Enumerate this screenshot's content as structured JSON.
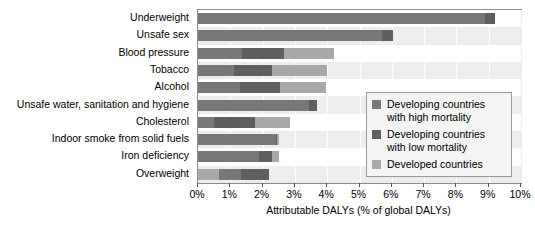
{
  "chart_data": {
    "type": "bar",
    "orientation": "horizontal",
    "stacked": true,
    "title": "",
    "xlabel": "Attributable DALYs (% of global DALYs)",
    "ylabel": "",
    "xlim": [
      0,
      10
    ],
    "xtick_labels": [
      "0%",
      "1%",
      "2%",
      "3%",
      "4%",
      "5%",
      "6%",
      "7%",
      "8%",
      "9%",
      "10%"
    ],
    "xticks": [
      0,
      1,
      2,
      3,
      4,
      5,
      6,
      7,
      8,
      9,
      10
    ],
    "grid": true,
    "legend_position": "center-right",
    "categories": [
      "Underweight",
      "Unsafe sex",
      "Blood pressure",
      "Tobacco",
      "Alcohol",
      "Unsafe water, sanitation and hygiene",
      "Cholesterol",
      "Indoor smoke from solid fuels",
      "Iron deficiency",
      "Overweight"
    ],
    "series": [
      {
        "name": "Developing countries with high mortality",
        "color": "#787878",
        "values": [
          8.9,
          5.7,
          1.35,
          1.1,
          1.3,
          3.45,
          0.5,
          2.4,
          1.9,
          0.0
        ]
      },
      {
        "name": "Developing countries with low mortality",
        "color": "#5f5f5f",
        "values": [
          0.3,
          0.35,
          1.3,
          1.2,
          1.25,
          0.25,
          1.25,
          0.05,
          0.4,
          0.0
        ]
      },
      {
        "name": "Developed countries",
        "color": "#a8a8a8",
        "values": [
          0.0,
          0.0,
          1.55,
          1.7,
          1.4,
          0.0,
          1.1,
          0.05,
          0.2,
          2.2
        ]
      }
    ],
    "totals": [
      9.2,
      6.05,
      4.2,
      4.0,
      3.95,
      3.7,
      2.85,
      2.5,
      2.5,
      2.2
    ],
    "segment_order_note": "Overweight is drawn as Developed(0.65) then High(0.68) then Low(0.87)",
    "overweight_segments": [
      {
        "series": "Developed countries",
        "value": 0.65
      },
      {
        "series": "Developing countries with high mortality",
        "value": 0.68
      },
      {
        "series": "Developing countries with low mortality",
        "value": 0.87
      }
    ]
  },
  "legend": {
    "items": [
      {
        "label": "Developing countries\nwith high mortality",
        "color": "#787878"
      },
      {
        "label": "Developing countries\nwith low mortality",
        "color": "#5f5f5f"
      },
      {
        "label": "Developed countries",
        "color": "#a8a8a8"
      }
    ]
  },
  "colors": {
    "plot_background": "#ededed",
    "band_background": "#ffffff",
    "plot_border": "#8c8c8c",
    "legend_background": "#f4f4f4",
    "legend_border": "#9a9a9a",
    "text": "#000000"
  }
}
